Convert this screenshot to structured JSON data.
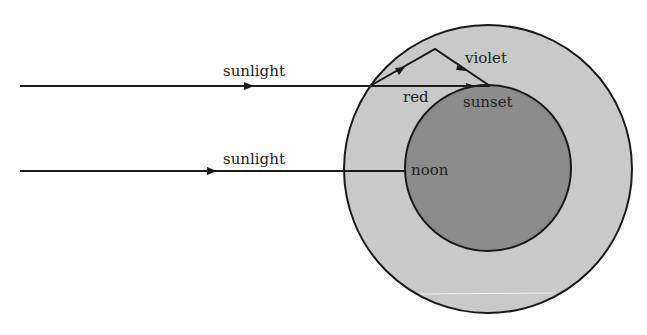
{
  "diagram": {
    "title": "",
    "colors": {
      "background": "#ffffff",
      "outer_ring": "#c9c9c9",
      "inner_disk": "#8c8c8c",
      "stroke": "#1a1a1a",
      "text": "#222222"
    },
    "shapes": {
      "atmosphere": {
        "cx": 488,
        "cy": 169,
        "r": 144
      },
      "earth": {
        "cx": 488,
        "cy": 168,
        "r": 83
      }
    },
    "rays": [
      {
        "id": "sunlight-sunset",
        "label": "sunlight",
        "from": [
          20,
          86
        ],
        "to": [
          490,
          86
        ],
        "arrow_at": [
          250,
          86
        ]
      },
      {
        "id": "violet-scatter",
        "label": "violet",
        "points": [
          [
            370,
            86
          ],
          [
            435,
            49
          ],
          [
            490,
            86
          ]
        ],
        "arrows_at": [
          [
            401,
            69
          ],
          [
            463,
            68
          ]
        ]
      },
      {
        "id": "red-transmit",
        "label": "red",
        "arrow_at": [
          472,
          86
        ]
      },
      {
        "id": "sunlight-noon",
        "label": "sunlight",
        "from": [
          20,
          171
        ],
        "to": [
          405,
          171
        ],
        "arrow_at": [
          213,
          171
        ]
      }
    ],
    "labels": {
      "sunlight_top": "sunlight",
      "sunlight_bottom": "sunlight",
      "violet": "violet",
      "red": "red",
      "sunset": "sunset",
      "noon": "noon"
    }
  }
}
